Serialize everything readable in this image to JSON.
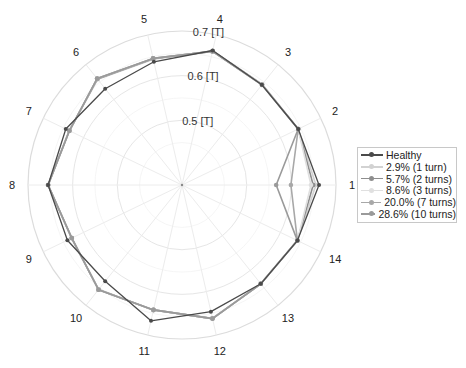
{
  "chart_data": {
    "type": "radar",
    "title": "",
    "categories": [
      "1",
      "2",
      "3",
      "4",
      "5",
      "6",
      "7",
      "8",
      "9",
      "10",
      "11",
      "12",
      "13",
      "14"
    ],
    "radial_ticks": [
      {
        "value": 0.5,
        "label": "0.5 [T]"
      },
      {
        "value": 0.6,
        "label": "0.6 [T]"
      },
      {
        "value": 0.7,
        "label": "0.7 [T]"
      }
    ],
    "rlim": [
      0.355,
      0.7
    ],
    "grid": true,
    "legend_position": "right",
    "series": [
      {
        "name": "Healthy",
        "color": "#4a4a4a",
        "values": [
          0.662,
          0.644,
          0.642,
          0.664,
          0.638,
          0.631,
          0.644,
          0.655,
          0.64,
          0.631,
          0.667,
          0.646,
          0.638,
          0.642
        ]
      },
      {
        "name": "2.9% (1 turn)",
        "color": "#d2d2d2",
        "values": [
          0.655,
          0.644,
          0.643,
          0.663,
          0.644,
          0.658,
          0.636,
          0.655,
          0.63,
          0.654,
          0.643,
          0.661,
          0.638,
          0.642
        ]
      },
      {
        "name": "5.7% (2 turns)",
        "color": "#8e8e8e",
        "values": [
          0.649,
          0.644,
          0.643,
          0.663,
          0.645,
          0.659,
          0.635,
          0.655,
          0.629,
          0.655,
          0.642,
          0.662,
          0.638,
          0.642
        ]
      },
      {
        "name": "8.6% (3 turns)",
        "color": "#e0e0e0",
        "values": [
          0.644,
          0.644,
          0.643,
          0.662,
          0.646,
          0.66,
          0.635,
          0.655,
          0.629,
          0.655,
          0.642,
          0.662,
          0.638,
          0.642
        ]
      },
      {
        "name": "20.0% (7 turns)",
        "color": "#a8a8a8",
        "values": [
          0.599,
          0.644,
          0.642,
          0.662,
          0.646,
          0.66,
          0.635,
          0.655,
          0.629,
          0.655,
          0.642,
          0.662,
          0.638,
          0.642
        ]
      },
      {
        "name": "28.6% (10 turns)",
        "color": "#9a9a9a",
        "values": [
          0.566,
          0.644,
          0.642,
          0.662,
          0.646,
          0.66,
          0.635,
          0.655,
          0.629,
          0.655,
          0.642,
          0.662,
          0.638,
          0.642
        ]
      }
    ]
  },
  "legend": {
    "items": [
      {
        "label": "Healthy"
      },
      {
        "label": "2.9% (1 turn)"
      },
      {
        "label": "5.7% (2 turns)"
      },
      {
        "label": "8.6% (3 turns)"
      },
      {
        "label": "20.0% (7 turns)"
      },
      {
        "label": "28.6% (10 turns)"
      }
    ]
  }
}
